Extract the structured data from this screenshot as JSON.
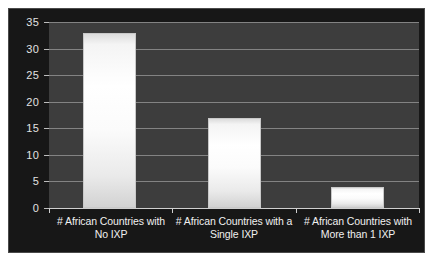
{
  "chart_data": {
    "type": "bar",
    "title": "",
    "subtitle": "",
    "xlabel": "",
    "ylabel": "",
    "categories": [
      "# African Countries with No IXP",
      "# African Countries with a Single IXP",
      "# African Countries with More than 1 IXP"
    ],
    "category_lines": [
      [
        "# African Countries with",
        "No IXP"
      ],
      [
        "# African Countries with a",
        "Single IXP"
      ],
      [
        "# African Countries with",
        "More than 1 IXP"
      ]
    ],
    "values": [
      33,
      17,
      4
    ],
    "ylim": [
      0,
      35
    ],
    "ytick_step": 5,
    "yticks": [
      0,
      5,
      10,
      15,
      20,
      25,
      30,
      35
    ],
    "ytick_labels": [
      "0",
      "5",
      "10",
      "15",
      "20",
      "25",
      "30",
      "35"
    ],
    "grid": true,
    "grid_axis": "y",
    "legend": false,
    "legend_position": "none",
    "series": [
      {
        "name": "African Countries",
        "values": [
          33,
          17,
          4
        ]
      }
    ]
  },
  "style": {
    "page_background": "#ffffff",
    "frame_background": "#171717",
    "plot_background": "#3d3d3d",
    "gridline_color": "#8f8f8f",
    "axis_color": "#cfcfcf",
    "tick_label_color": "#e2e2e2",
    "category_label_color": "#f0f0f0",
    "bar_color": "#ffffff",
    "bar_edge_color": "#c9c9c9"
  }
}
